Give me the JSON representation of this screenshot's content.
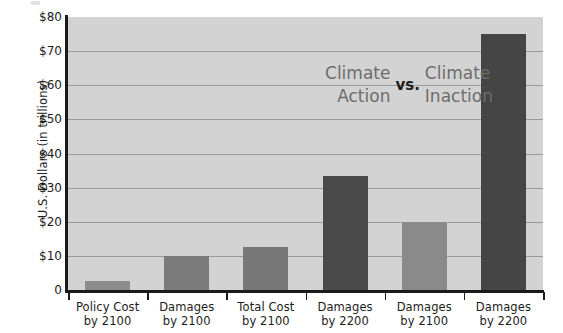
{
  "chart_data": {
    "type": "bar",
    "title": "",
    "subtitle": "",
    "xlabel": "",
    "ylabel": "U.S. Dollars  (in trillions)",
    "ylim": [
      0,
      80
    ],
    "ytick_step": 10,
    "grid": true,
    "legend": false,
    "categories": [
      "Policy Cost by 2100",
      "Damages by 2100",
      "Total Cost by 2100",
      "Damages by 2200",
      "Damages by 2100",
      "Damages by 2200"
    ],
    "category_lines": [
      [
        "Policy Cost",
        "by 2100"
      ],
      [
        "Damages",
        "by 2100"
      ],
      [
        "Total Cost",
        "by 2100"
      ],
      [
        "Damages",
        "by 2200"
      ],
      [
        "Damages",
        "by 2100"
      ],
      [
        "Damages",
        "by 2200"
      ]
    ],
    "values": [
      2.7,
      10,
      12.5,
      33.5,
      20,
      75
    ],
    "bar_colors": [
      "#8d8d8d",
      "#7b7b7b",
      "#777777",
      "#4a4a4a",
      "#8a8a8a",
      "#454545"
    ],
    "ytick_labels": [
      "$80",
      "$70",
      "$60",
      "$50",
      "$40",
      "$30",
      "$20",
      "$10",
      "0"
    ],
    "ytick_values": [
      80,
      70,
      60,
      50,
      40,
      30,
      20,
      10,
      0
    ],
    "annotations": [
      {
        "text": "Climate Action",
        "lines": [
          "Climate",
          "Action"
        ],
        "color": "#6d6d6d"
      },
      {
        "text": "vs.",
        "color": "#1c1c1c"
      },
      {
        "text": "Climate Inaction",
        "lines": [
          "Climate",
          "Inaction"
        ],
        "color": "#6d6d6d"
      }
    ],
    "plot_background": "#d3d3d3",
    "gridline_color": "#9a9a9a",
    "axis_color": "#1a1a1a"
  },
  "axis": {
    "y_title": "U.S. Dollars  (in trillions)"
  },
  "annotation": {
    "left_line1": "Climate",
    "left_line2": "Action",
    "vs": "vs.",
    "right_line1": "Climate",
    "right_line2": "Inaction"
  }
}
